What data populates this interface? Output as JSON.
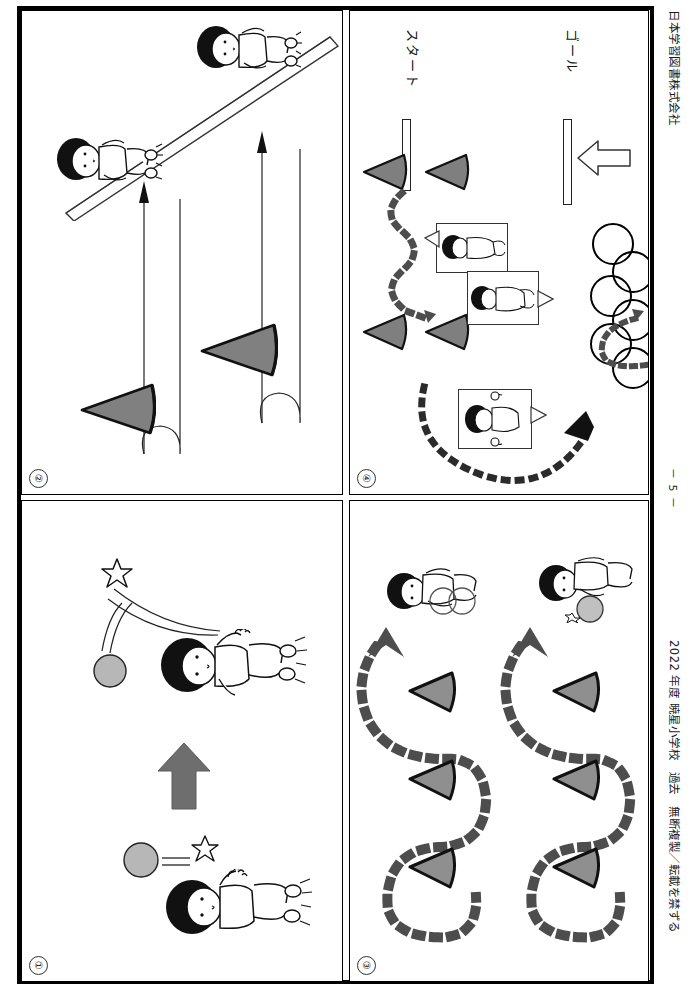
{
  "document": {
    "title_partial": "運動2",
    "publisher": "日本学習図書株式会社",
    "footer_notice": "2022 年度 暁星小学校　過去　無断複製／転載を禁ずる",
    "page_number": "－ 5 －",
    "orientation": "landscape-content-on-portrait-page (rotated 90°)"
  },
  "panels": [
    {
      "id": "panel-1",
      "number": "①",
      "position": "bottom-left",
      "description": "ball toss and catch exercise",
      "elements": {
        "arrow": "solid grey up-arrow (direction of movement)",
        "figures": [
          "child catching ball",
          "child throwing ball"
        ],
        "props": [
          "ball",
          "ball"
        ]
      }
    },
    {
      "id": "panel-2",
      "number": "②",
      "position": "top-left",
      "description": "run around cone and return, with balance beam / bar",
      "elements": {
        "cones": 2,
        "tracks": 2,
        "figures": [
          "child on beam",
          "child on beam"
        ],
        "props": [
          "balance beam"
        ]
      }
    },
    {
      "id": "panel-3",
      "number": "③",
      "position": "bottom-right",
      "description": "figure-eight slalom around three cones, two lanes",
      "elements": {
        "cones": 6,
        "lanes": 2,
        "arrows": 2,
        "figures": [
          "child with hoop",
          "child with ball"
        ]
      }
    },
    {
      "id": "panel-4",
      "number": "④",
      "position": "top-right",
      "description": "obstacle course: start, cone slalom, crawl, hoop jumps, goal",
      "labels": {
        "start": "スタート",
        "goal": "ゴール"
      },
      "elements": {
        "cones": 4,
        "hoops": 6,
        "bars": [
          "start line",
          "goal line"
        ],
        "inset_photos": 3,
        "arrow": "hollow outlined arrow toward goal"
      }
    }
  ],
  "colors": {
    "ink": "#000000",
    "cone_fill": "#808080",
    "cone_fill_light": "#9a9a9a",
    "arrow_fill": "#6e6e6e",
    "dot_fill": "#595959",
    "ball_fill": "#b5b5b5",
    "paper": "#ffffff"
  }
}
